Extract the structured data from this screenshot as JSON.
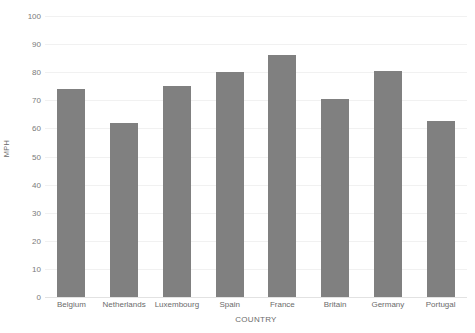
{
  "chart_data": {
    "type": "bar",
    "title": "",
    "subtitle": "",
    "xlabel": "COUNTRY",
    "ylabel": "MPH",
    "categories": [
      "Belgium",
      "Netherlands",
      "Luxembourg",
      "Spain",
      "France",
      "Britain",
      "Germany",
      "Portugal"
    ],
    "values": [
      74,
      62,
      75,
      80,
      86,
      70.5,
      80.5,
      62.5
    ],
    "series": [
      {
        "name": "MPH",
        "values": [
          74,
          62,
          75,
          80,
          86,
          70.5,
          80.5,
          62.5
        ]
      }
    ],
    "ylim": [
      0,
      100
    ],
    "yticks": [
      0,
      10,
      20,
      30,
      40,
      50,
      60,
      70,
      80,
      90,
      100
    ],
    "ytick_labels": [
      "0",
      "10",
      "20",
      "30",
      "40",
      "50",
      "60",
      "70",
      "80",
      "90",
      "100"
    ],
    "grid": true,
    "grid_axis": "y",
    "legend": false,
    "legend_position": "none",
    "bar_color": "#808080",
    "gridline_color": "#f1f1f1",
    "axis_text_color": "#6b6b6b",
    "background_color": "#ffffff",
    "annotations": []
  }
}
